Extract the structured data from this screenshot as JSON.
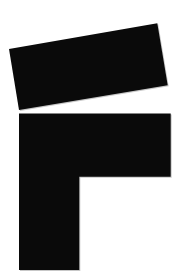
{
  "page": {
    "background_color": "#ffffff"
  },
  "logo": {
    "fill_color": "#0a0a0a",
    "top_bar": {
      "shape": "quadrilateral",
      "points": "9,49 157.3,23.3 167.7,85.3 19,110"
    },
    "body": {
      "shape": "L-polygon",
      "points": "19,113.5 170.7,113.5 170.7,176.7 79.3,176.7 79.3,270 19,270"
    },
    "viewbox": "0 0 180 280"
  }
}
